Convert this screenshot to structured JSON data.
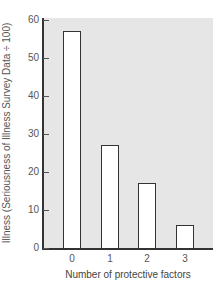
{
  "chart_data": {
    "type": "bar",
    "title": "",
    "xlabel": "Number of protective factors",
    "ylabel": "Illness (Seriousness of Illness Survey Data ÷ 100)",
    "categories": [
      "0",
      "1",
      "2",
      "3"
    ],
    "values": [
      57,
      27,
      17,
      6
    ],
    "ylim": [
      0,
      60
    ],
    "yticks": [
      "0",
      "10",
      "20",
      "30",
      "40",
      "50",
      "60"
    ],
    "grid": false,
    "legend": null,
    "colors": {
      "bar_fill": "#ffffff",
      "bar_edge": "#333333",
      "plot_background": "#e6e6e6"
    }
  },
  "axis": {
    "ylabel": "Illness (Seriousness of Illness Survey Data ÷ 100)",
    "xlabel": "Number of protective factors",
    "yticks": [
      "0",
      "10",
      "20",
      "30",
      "40",
      "50",
      "60"
    ],
    "xticks": [
      "0",
      "1",
      "2",
      "3"
    ]
  }
}
